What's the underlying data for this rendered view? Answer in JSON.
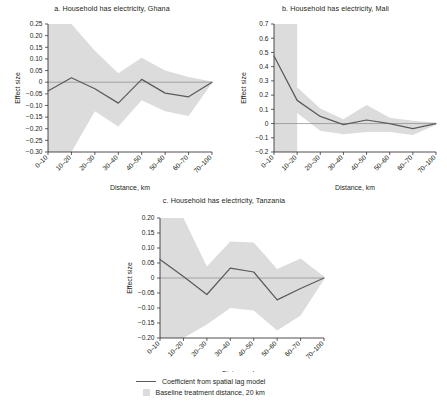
{
  "figure": {
    "panels": [
      {
        "key": "ghana",
        "title": "a. Household has electricity, Ghana",
        "ylabel": "Effect size",
        "xlabel": "Distance, km"
      },
      {
        "key": "mali",
        "title": "b. Household has electricity, Mali",
        "ylabel": "Effect size",
        "xlabel": "Distance, km"
      },
      {
        "key": "tanzania",
        "title": "c. Household has electricity, Tanzania",
        "ylabel": "Effect size",
        "xlabel": "Distance, km"
      }
    ],
    "legend": [
      {
        "marker": "line",
        "label": "Coefficient from spatial lag model"
      },
      {
        "marker": "box",
        "label": "Baseline treatment distance, 20 km"
      }
    ]
  },
  "chart_data": [
    {
      "type": "line",
      "key": "ghana",
      "title": "a. Household has electricity, Ghana",
      "xlabel": "Distance, km",
      "ylabel": "Effect size",
      "categories": [
        "0–10",
        "10–20",
        "20–30",
        "30–40",
        "40–50",
        "50–60",
        "60–70",
        "70–100"
      ],
      "ytick_labels": [
        "0.25",
        "0.20",
        "0.15",
        "0.10",
        "0.05",
        "0",
        "−0.05",
        "−0.10",
        "−0.15",
        "−0.20",
        "−0.25",
        "−0.30"
      ],
      "ytick_values": [
        0.25,
        0.2,
        0.15,
        0.1,
        0.05,
        0,
        -0.05,
        -0.1,
        -0.15,
        -0.2,
        -0.25,
        -0.3
      ],
      "ylim": [
        -0.3,
        0.25
      ],
      "grid": false,
      "zero_line": true,
      "series": [
        {
          "name": "Coefficient from spatial lag model",
          "values": [
            -0.038,
            0.019,
            -0.028,
            -0.09,
            0.012,
            -0.047,
            -0.063,
            0.0
          ],
          "ci_upper": [
            0.25,
            0.25,
            0.135,
            0.038,
            0.105,
            0.05,
            0.022,
            0.003
          ],
          "ci_lower": [
            -0.3,
            -0.3,
            -0.125,
            -0.19,
            -0.078,
            -0.125,
            -0.145,
            -0.003
          ]
        }
      ],
      "baseline_treatment_distance_km": 20,
      "baseline_band_categories": [
        "0–10",
        "10–20"
      ]
    },
    {
      "type": "line",
      "key": "mali",
      "title": "b. Household has electricity, Mali",
      "xlabel": "Distance, km",
      "ylabel": "Effect size",
      "categories": [
        "0–10",
        "10–20",
        "20–30",
        "30–40",
        "40–50",
        "50–60",
        "60–70",
        "70–100"
      ],
      "ytick_labels": [
        "0.7",
        "0.6",
        "0.5",
        "0.4",
        "0.3",
        "0.2",
        "0.1",
        "0",
        "−0.1",
        "−0.2"
      ],
      "ytick_values": [
        0.7,
        0.6,
        0.5,
        0.4,
        0.3,
        0.2,
        0.1,
        0,
        -0.1,
        -0.2
      ],
      "ylim": [
        -0.2,
        0.7
      ],
      "grid": false,
      "zero_line": true,
      "series": [
        {
          "name": "Coefficient from spatial lag model",
          "values": [
            0.475,
            0.163,
            0.05,
            -0.008,
            0.025,
            0.0,
            -0.035,
            0.0
          ],
          "ci_upper": [
            0.7,
            0.255,
            0.105,
            0.03,
            0.13,
            0.04,
            0.02,
            0.008
          ],
          "ci_lower": [
            0.22,
            0.075,
            -0.05,
            -0.075,
            -0.06,
            -0.06,
            -0.08,
            -0.008
          ]
        }
      ],
      "baseline_treatment_distance_km": 20,
      "baseline_band_categories": [
        "0–10",
        "10–20"
      ]
    },
    {
      "type": "line",
      "key": "tanzania",
      "title": "c. Household has electricity, Tanzania",
      "xlabel": "Distance, km",
      "ylabel": "Effect size",
      "categories": [
        "0–10",
        "10–20",
        "20–30",
        "30–40",
        "40–50",
        "50–60",
        "60–70",
        "70–100"
      ],
      "ytick_labels": [
        "0.20",
        "0.15",
        "0.10",
        "0.05",
        "0",
        "−0.05",
        "−0.10",
        "−0.15",
        "−0.20"
      ],
      "ytick_values": [
        0.2,
        0.15,
        0.1,
        0.05,
        0,
        -0.05,
        -0.1,
        -0.15,
        -0.2
      ],
      "ylim": [
        -0.2,
        0.2
      ],
      "grid": false,
      "zero_line": true,
      "series": [
        {
          "name": "Coefficient from spatial lag model",
          "values": [
            0.062,
            0.005,
            -0.055,
            0.033,
            0.02,
            -0.073,
            -0.035,
            0.0
          ],
          "ci_upper": [
            0.2,
            0.2,
            0.038,
            0.122,
            0.118,
            0.03,
            0.065,
            0.005
          ],
          "ci_lower": [
            -0.2,
            -0.2,
            -0.155,
            -0.1,
            -0.108,
            -0.175,
            -0.125,
            -0.005
          ]
        }
      ],
      "baseline_treatment_distance_km": 20,
      "baseline_band_categories": [
        "0–10",
        "10–20"
      ]
    }
  ]
}
